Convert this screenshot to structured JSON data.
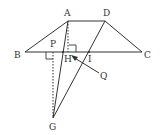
{
  "diagram": {
    "type": "geometry",
    "points": {
      "A": {
        "label": "A",
        "x": 68,
        "y": 21,
        "lx": 64,
        "ly": 16
      },
      "D": {
        "label": "D",
        "x": 105,
        "y": 21,
        "lx": 103,
        "ly": 16
      },
      "B": {
        "label": "B",
        "x": 25,
        "y": 52,
        "lx": 14,
        "ly": 58
      },
      "C": {
        "label": "C",
        "x": 142,
        "y": 52,
        "lx": 144,
        "ly": 58
      },
      "P": {
        "label": "P",
        "x": 53,
        "y": 52,
        "lx": 50,
        "ly": 47
      },
      "H": {
        "label": "H",
        "x": 63,
        "y": 52,
        "lx": 64,
        "ly": 62
      },
      "I": {
        "label": "I",
        "x": 89,
        "y": 52,
        "lx": 88,
        "ly": 62
      },
      "G": {
        "label": "G",
        "x": 53,
        "y": 118,
        "lx": 49,
        "ly": 130
      },
      "Q": {
        "label": "Q",
        "x": 100,
        "y": 73,
        "lx": 100,
        "ly": 79
      }
    },
    "segments": [
      {
        "from": "A",
        "to": "D",
        "style": "solid"
      },
      {
        "from": "A",
        "to": "B",
        "style": "solid"
      },
      {
        "from": "D",
        "to": "C",
        "style": "solid"
      },
      {
        "from": "B",
        "to": "C",
        "style": "solid"
      },
      {
        "from": "A",
        "to": "G",
        "style": "solid"
      },
      {
        "from": "D",
        "to": "G",
        "style": "solid"
      },
      {
        "from": "A",
        "to": "H",
        "style": "dotted"
      },
      {
        "from": "P",
        "to": "G",
        "style": "dotted"
      }
    ],
    "right_angles": [
      "H",
      "P"
    ],
    "arrow": {
      "from": "Q",
      "to": "H"
    },
    "stroke_color": "#333333"
  }
}
